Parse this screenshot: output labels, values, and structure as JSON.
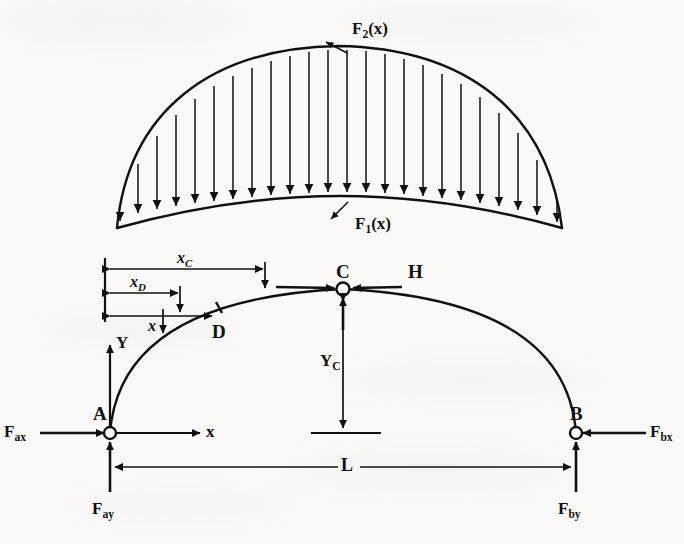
{
  "figure": {
    "type": "three-hinged-arch-free-body-diagram",
    "ink_color": "#111111",
    "paper_color": "#fbfaf8"
  },
  "load_diagram": {
    "name": "distributed-load-diagram",
    "upper_curve_label": "F",
    "upper_curve_sub": "2",
    "upper_curve_arg": "(x)",
    "lower_curve_label": "F",
    "lower_curve_sub": "1",
    "lower_curve_arg": "(x)",
    "arrow_count": 23,
    "arrow_direction": "down"
  },
  "arch": {
    "points": [
      {
        "id": "A",
        "label": "A",
        "kind": "pin-support"
      },
      {
        "id": "D",
        "label": "D",
        "kind": "section-point"
      },
      {
        "id": "C",
        "label": "C",
        "kind": "crown-hinge"
      },
      {
        "id": "B",
        "label": "B",
        "kind": "pin-support"
      }
    ]
  },
  "forces": [
    {
      "id": "Fax",
      "label": "F",
      "sub": "ax",
      "direction": "right",
      "at": "A"
    },
    {
      "id": "Fay",
      "label": "F",
      "sub": "ay",
      "direction": "up",
      "at": "A"
    },
    {
      "id": "Fbx",
      "label": "F",
      "sub": "bx",
      "direction": "left",
      "at": "B"
    },
    {
      "id": "Fby",
      "label": "F",
      "sub": "by",
      "direction": "up",
      "at": "B"
    },
    {
      "id": "H",
      "label": "H",
      "sub": "",
      "direction": "horizontal-pair",
      "at": "C"
    }
  ],
  "dimensions": [
    {
      "id": "xC",
      "label": "x",
      "sub": "C",
      "orientation": "horizontal",
      "from": "A",
      "to": "C"
    },
    {
      "id": "xD",
      "label": "x",
      "sub": "D",
      "orientation": "horizontal",
      "from": "A",
      "to": "D"
    },
    {
      "id": "x",
      "label": "x",
      "sub": "",
      "orientation": "horizontal",
      "from": "A",
      "to": "x"
    },
    {
      "id": "YC",
      "label": "Y",
      "sub": "C",
      "orientation": "vertical",
      "from": "C",
      "to": "base"
    },
    {
      "id": "L",
      "label": "L",
      "sub": "",
      "orientation": "horizontal",
      "from": "A",
      "to": "B"
    }
  ],
  "axes": [
    {
      "id": "Y",
      "label": "Y",
      "direction": "up",
      "origin": "A"
    },
    {
      "id": "x",
      "label": "x",
      "direction": "right",
      "origin": "A"
    }
  ]
}
